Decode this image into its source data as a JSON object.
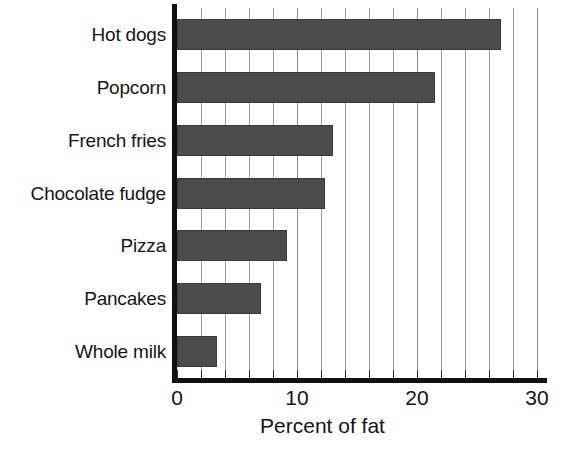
{
  "chart_data": {
    "type": "bar",
    "orientation": "horizontal",
    "title": "",
    "subtitle": "",
    "xlabel": "Percent of fat",
    "ylabel": "",
    "categories": [
      "Hot dogs",
      "Popcorn",
      "French fries",
      "Chocolate fudge",
      "Pizza",
      "Pancakes",
      "Whole milk"
    ],
    "values": [
      27,
      21.5,
      13,
      12.3,
      9.2,
      7,
      3.3
    ],
    "series": [
      {
        "name": "Percent of fat",
        "values": [
          27,
          21.5,
          13,
          12.3,
          9.2,
          7,
          3.3
        ]
      }
    ],
    "xlim": [
      0,
      30
    ],
    "ylim": [
      0,
      7
    ],
    "x_major_ticks": [
      0,
      10,
      20,
      30
    ],
    "x_major_tick_labels": [
      "0",
      "10",
      "20",
      "30"
    ],
    "x_minor_tick_step": 2,
    "x_all_ticks": [
      0,
      2,
      4,
      6,
      8,
      10,
      12,
      14,
      16,
      18,
      20,
      22,
      24,
      26,
      28,
      30
    ],
    "grid": true,
    "grid_axis": "x",
    "legend": false,
    "legend_position": "none",
    "annotations": [],
    "colors": {
      "bar_fill": "#4b4b4b",
      "bar_edge": "#3a3a3a",
      "gridline": "#9a9a9a",
      "axis": "#111111",
      "text": "#141414",
      "background": "#ffffff"
    }
  },
  "axis": {
    "x_title": "Percent of fat",
    "tick_labels": [
      "0",
      "10",
      "20",
      "30"
    ]
  },
  "bars": [
    {
      "label": "Hot dogs",
      "value": 27
    },
    {
      "label": "Popcorn",
      "value": 21.5
    },
    {
      "label": "French fries",
      "value": 13
    },
    {
      "label": "Chocolate fudge",
      "value": 12.3
    },
    {
      "label": "Pizza",
      "value": 9.2
    },
    {
      "label": "Pancakes",
      "value": 7
    },
    {
      "label": "Whole milk",
      "value": 3.3
    }
  ]
}
